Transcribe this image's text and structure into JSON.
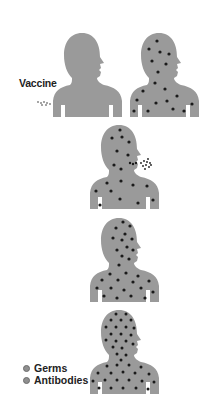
{
  "diagram": {
    "title": "",
    "figures": [
      {
        "id": "stage-1",
        "description": "person receiving vaccine, no germs"
      },
      {
        "id": "stage-2",
        "description": "germs spread through body"
      },
      {
        "id": "stage-3",
        "description": "germs and antibodies, germs expelled from mouth"
      },
      {
        "id": "stage-4",
        "description": "antibodies increasing"
      },
      {
        "id": "stage-5",
        "description": "body full of antibodies"
      }
    ],
    "vaccine_label": "Vaccine",
    "legend": [
      {
        "label": "Germs"
      },
      {
        "label": "Antibodies"
      }
    ],
    "colors": {
      "body": "#9a9a9a",
      "germ": "#1a1a1a",
      "antibody": "#3a3a3a",
      "text": "#222222"
    }
  }
}
